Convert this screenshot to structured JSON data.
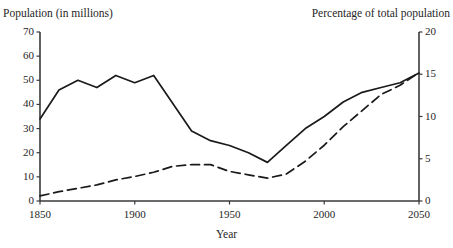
{
  "chart_data": {
    "type": "line",
    "title": "",
    "xlabel": "Year",
    "ylabel": "Population (in millions)",
    "y2label": "Percentage of total population",
    "xlim": [
      1850,
      2050
    ],
    "ylim": [
      0,
      70
    ],
    "y2lim": [
      0,
      20
    ],
    "xticks": [
      "1850",
      "1900",
      "1950",
      "2000",
      "2050"
    ],
    "yticks": [
      "0",
      "10",
      "20",
      "30",
      "40",
      "50",
      "60",
      "70"
    ],
    "y2ticks": [
      "0",
      "5",
      "10",
      "15",
      "20"
    ],
    "grid": false,
    "legend": "none",
    "series": [
      {
        "name": "Population (in millions)",
        "axis": "left",
        "style": "solid",
        "color": "#1a1a1a",
        "x": [
          1850,
          1860,
          1870,
          1880,
          1890,
          1900,
          1910,
          1930,
          1940,
          1950,
          1960,
          1970,
          1980,
          1990,
          2000,
          2010,
          2020,
          2030,
          2040,
          2050
        ],
        "values": [
          34,
          46,
          50,
          47,
          52,
          49,
          52,
          29,
          25,
          23,
          20,
          16,
          23,
          30,
          35,
          41,
          45,
          47,
          49,
          53
        ]
      },
      {
        "name": "Percentage of total population",
        "axis": "right",
        "style": "dashed",
        "color": "#1a1a1a",
        "x": [
          1850,
          1860,
          1870,
          1880,
          1890,
          1900,
          1910,
          1920,
          1930,
          1940,
          1950,
          1960,
          1970,
          1980,
          1990,
          2000,
          2010,
          2020,
          2030,
          2040,
          2050
        ],
        "values": [
          0.6,
          1.1,
          1.5,
          1.9,
          2.5,
          2.9,
          3.4,
          4.1,
          4.3,
          4.3,
          3.5,
          3.1,
          2.7,
          3.2,
          4.7,
          6.6,
          8.8,
          10.7,
          12.6,
          13.7,
          15.2
        ]
      }
    ]
  },
  "axes": {
    "left_title": "Population (in millions)",
    "right_title": "Percentage of total population",
    "x_title": "Year"
  },
  "geometry": {
    "plot_left": 40,
    "plot_right": 419,
    "plot_top": 32,
    "plot_bottom": 201
  }
}
